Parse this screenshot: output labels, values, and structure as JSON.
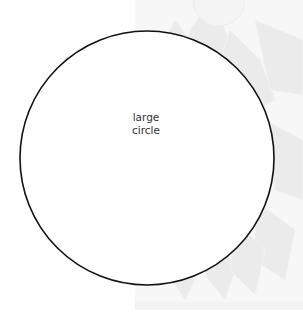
{
  "diagram": {
    "shape": "circle",
    "label_line1": "large",
    "label_line2": "circle",
    "stroke_color": "#111111",
    "fill_color": "#ffffff",
    "center": [
      147,
      158
    ],
    "radius": 127
  },
  "background": {
    "pattern": "faint-flower-petals",
    "color": "#f7f7f7",
    "petal_color": "#ececec"
  }
}
